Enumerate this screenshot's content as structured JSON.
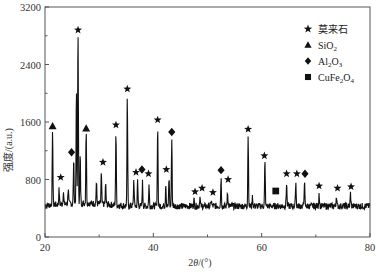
{
  "chart_data": {
    "type": "line",
    "title": "",
    "xlabel": "2θ/(°)",
    "ylabel": "强度/(a.u.)",
    "xlim": [
      20,
      80
    ],
    "ylim": [
      0,
      3200
    ],
    "x_ticks": [
      20,
      40,
      60,
      80
    ],
    "y_ticks": [
      0,
      800,
      1600,
      2400,
      3200
    ],
    "x_minor_ticks": [
      30,
      50,
      70
    ],
    "y_minor_ticks": [
      400,
      1200,
      2000,
      2800
    ],
    "grid": false,
    "legend_position": "upper right",
    "baseline": 430,
    "legend": [
      {
        "marker": "star",
        "label": "莫来石"
      },
      {
        "marker": "triangle",
        "label": "SiO",
        "sub": "2",
        "tail": ""
      },
      {
        "marker": "diamond",
        "label": "Al",
        "sub": "2",
        "mid": "O",
        "sub2": "3"
      },
      {
        "marker": "square",
        "label": "CuFe",
        "sub": "2",
        "mid": "O",
        "sub2": "4"
      }
    ],
    "series": [
      {
        "name": "XRD pattern",
        "peaks": [
          {
            "two_theta": 21.4,
            "intensity": 1450
          },
          {
            "two_theta": 22.6,
            "intensity": 640
          },
          {
            "two_theta": 23.4,
            "intensity": 610
          },
          {
            "two_theta": 24.3,
            "intensity": 660
          },
          {
            "two_theta": 25.3,
            "intensity": 1050
          },
          {
            "two_theta": 25.8,
            "intensity": 2000
          },
          {
            "two_theta": 26.1,
            "intensity": 2820
          },
          {
            "two_theta": 26.5,
            "intensity": 1100
          },
          {
            "two_theta": 27.6,
            "intensity": 1460
          },
          {
            "two_theta": 29.5,
            "intensity": 720
          },
          {
            "two_theta": 30.4,
            "intensity": 860
          },
          {
            "two_theta": 31.2,
            "intensity": 700
          },
          {
            "two_theta": 33.1,
            "intensity": 1450
          },
          {
            "two_theta": 35.2,
            "intensity": 1950
          },
          {
            "two_theta": 36.4,
            "intensity": 800
          },
          {
            "two_theta": 37.1,
            "intensity": 780
          },
          {
            "two_theta": 38.0,
            "intensity": 760
          },
          {
            "two_theta": 39.2,
            "intensity": 720
          },
          {
            "two_theta": 40.8,
            "intensity": 1560
          },
          {
            "two_theta": 42.3,
            "intensity": 760
          },
          {
            "two_theta": 42.9,
            "intensity": 820
          },
          {
            "two_theta": 43.4,
            "intensity": 1360
          },
          {
            "two_theta": 47.5,
            "intensity": 520
          },
          {
            "two_theta": 48.6,
            "intensity": 560
          },
          {
            "two_theta": 50.7,
            "intensity": 520
          },
          {
            "two_theta": 52.5,
            "intensity": 820
          },
          {
            "two_theta": 53.7,
            "intensity": 640
          },
          {
            "two_theta": 57.5,
            "intensity": 1420
          },
          {
            "two_theta": 58.3,
            "intensity": 560
          },
          {
            "two_theta": 60.6,
            "intensity": 1050
          },
          {
            "two_theta": 64.6,
            "intensity": 770
          },
          {
            "two_theta": 66.3,
            "intensity": 780
          },
          {
            "two_theta": 67.9,
            "intensity": 780
          },
          {
            "two_theta": 70.6,
            "intensity": 620
          },
          {
            "two_theta": 73.8,
            "intensity": 580
          },
          {
            "two_theta": 76.4,
            "intensity": 610
          }
        ]
      }
    ],
    "annotations": [
      {
        "marker": "triangle",
        "two_theta": 21.4,
        "intensity": 1540
      },
      {
        "marker": "star",
        "two_theta": 22.9,
        "intensity": 830
      },
      {
        "marker": "diamond",
        "two_theta": 24.9,
        "intensity": 1180
      },
      {
        "marker": "star",
        "two_theta": 26.1,
        "intensity": 2880
      },
      {
        "marker": "triangle",
        "two_theta": 27.6,
        "intensity": 1510
      },
      {
        "marker": "star",
        "two_theta": 30.7,
        "intensity": 1040
      },
      {
        "marker": "star",
        "two_theta": 33.1,
        "intensity": 1560
      },
      {
        "marker": "star",
        "two_theta": 35.2,
        "intensity": 2060
      },
      {
        "marker": "star",
        "two_theta": 36.8,
        "intensity": 900
      },
      {
        "marker": "diamond",
        "two_theta": 37.9,
        "intensity": 940
      },
      {
        "marker": "star",
        "two_theta": 39.1,
        "intensity": 880
      },
      {
        "marker": "star",
        "two_theta": 40.8,
        "intensity": 1630
      },
      {
        "marker": "star",
        "two_theta": 42.4,
        "intensity": 940
      },
      {
        "marker": "diamond",
        "two_theta": 43.4,
        "intensity": 1460
      },
      {
        "marker": "star",
        "two_theta": 47.7,
        "intensity": 630
      },
      {
        "marker": "star",
        "two_theta": 49.0,
        "intensity": 680
      },
      {
        "marker": "star",
        "two_theta": 51.0,
        "intensity": 620
      },
      {
        "marker": "diamond",
        "two_theta": 52.5,
        "intensity": 930
      },
      {
        "marker": "star",
        "two_theta": 53.8,
        "intensity": 800
      },
      {
        "marker": "star",
        "two_theta": 57.5,
        "intensity": 1500
      },
      {
        "marker": "star",
        "two_theta": 60.5,
        "intensity": 1130
      },
      {
        "marker": "square",
        "two_theta": 62.6,
        "intensity": 640
      },
      {
        "marker": "star",
        "two_theta": 64.6,
        "intensity": 880
      },
      {
        "marker": "star",
        "two_theta": 66.5,
        "intensity": 880
      },
      {
        "marker": "diamond",
        "two_theta": 68.0,
        "intensity": 880
      },
      {
        "marker": "star",
        "two_theta": 70.6,
        "intensity": 710
      },
      {
        "marker": "star",
        "two_theta": 74.0,
        "intensity": 680
      },
      {
        "marker": "star",
        "two_theta": 76.5,
        "intensity": 700
      }
    ]
  },
  "colors": {
    "line": "#111111",
    "axis": "#555555",
    "marker": "#111111",
    "text": "#333333"
  }
}
